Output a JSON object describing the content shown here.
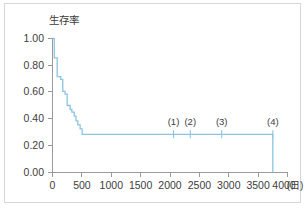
{
  "figure": {
    "background_color": "#ffffff",
    "frame_color": "#d6d6d6",
    "line_color": "#8cc4e2",
    "axis_color": "#9a9a9a",
    "text_color": "#3c3c3c"
  },
  "chart_data": {
    "type": "line",
    "title": "",
    "subtitle": "",
    "xlabel": "(日)",
    "ylabel": "生存率",
    "xlim": [
      0,
      4000
    ],
    "ylim": [
      0.0,
      1.0
    ],
    "grid": false,
    "legend": "none",
    "x_ticks": [
      0,
      500,
      1000,
      1500,
      2000,
      2500,
      3000,
      3500,
      4000
    ],
    "x_tick_labels": [
      "0",
      "500",
      "1000",
      "1500",
      "2000",
      "2500",
      "3000",
      "3500",
      "4000"
    ],
    "x_unit_label": "(日)",
    "y_ticks": [
      0.0,
      0.2,
      0.4,
      0.6,
      0.8,
      1.0
    ],
    "y_tick_labels": [
      "0.00",
      "0.20",
      "0.40",
      "0.60",
      "0.80",
      "1.00"
    ],
    "series": [
      {
        "name": "生存率",
        "style": "step-post",
        "color": "#8cc4e2",
        "x": [
          0,
          30,
          30,
          80,
          80,
          140,
          140,
          175,
          175,
          215,
          215,
          250,
          250,
          300,
          300,
          330,
          330,
          370,
          370,
          400,
          400,
          430,
          430,
          470,
          470,
          505,
          505,
          3750,
          3750
        ],
        "y": [
          1.0,
          1.0,
          0.855,
          0.855,
          0.715,
          0.715,
          0.695,
          0.695,
          0.605,
          0.605,
          0.585,
          0.585,
          0.5,
          0.5,
          0.47,
          0.47,
          0.45,
          0.45,
          0.42,
          0.42,
          0.385,
          0.385,
          0.355,
          0.355,
          0.325,
          0.325,
          0.285,
          0.285,
          0.0
        ]
      }
    ],
    "plateau_value": 0.285,
    "drop_to_zero_x": 3750,
    "censor_marks": [
      {
        "label": "(1)",
        "x": 2060,
        "y": 0.285
      },
      {
        "label": "(2)",
        "x": 2345,
        "y": 0.285
      },
      {
        "label": "(3)",
        "x": 2880,
        "y": 0.285
      },
      {
        "label": "(4)",
        "x": 3750,
        "y": 0.285
      }
    ]
  }
}
